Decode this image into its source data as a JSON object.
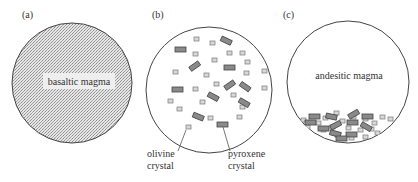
{
  "panels": [
    {
      "id": "a",
      "label": "(a)",
      "title": "basaltic magma"
    },
    {
      "id": "b",
      "label": "(b)",
      "annotations": [
        {
          "line1": "olivine",
          "line2": "crystal"
        },
        {
          "line1": "pyroxene",
          "line2": "crystal"
        }
      ]
    },
    {
      "id": "c",
      "label": "(c)",
      "title": "andesitic magma"
    }
  ],
  "colors": {
    "outline": "#444444",
    "stipple": "#9a9a9a",
    "olivine_fill": "#d8d8d8",
    "pyroxene_fill": "#8a8a8a"
  }
}
